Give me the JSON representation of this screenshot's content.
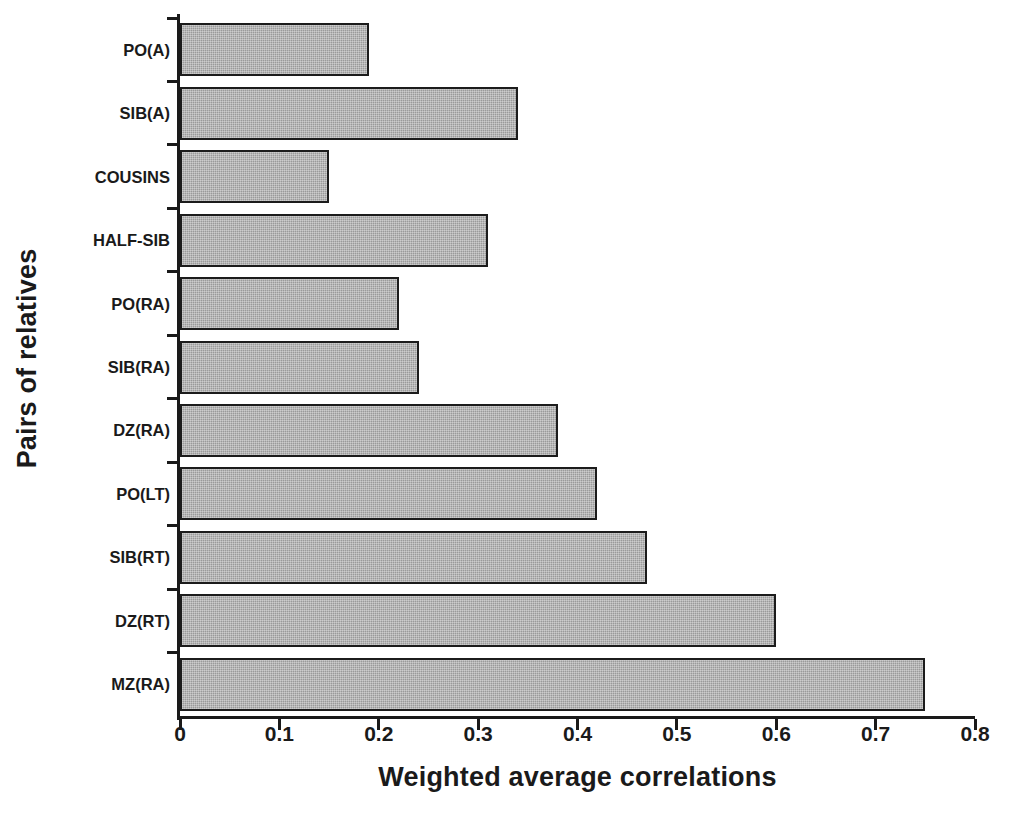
{
  "chart_data": {
    "type": "bar",
    "orientation": "horizontal",
    "title": "",
    "xlabel": "Weighted average correlations",
    "ylabel": "Pairs of relatives",
    "xlim": [
      0,
      0.8
    ],
    "xticks": [
      "0",
      "0.1",
      "0.2",
      "0.3",
      "0.4",
      "0.5",
      "0.6",
      "0.7",
      "0.8"
    ],
    "xtick_values": [
      0,
      0.1,
      0.2,
      0.3,
      0.4,
      0.5,
      0.6,
      0.7,
      0.8
    ],
    "grid": false,
    "legend": false,
    "bar_fill_color": "#9a9a9a",
    "bar_edge_color": "#1c1c1c",
    "categories": [
      "PO(A)",
      "SIB(A)",
      "COUSINS",
      "HALF-SIB",
      "PO(RA)",
      "SIB(RA)",
      "DZ(RA)",
      "PO(LT)",
      "SIB(RT)",
      "DZ(RT)",
      "MZ(RA)"
    ],
    "values": [
      0.19,
      0.34,
      0.15,
      0.31,
      0.22,
      0.24,
      0.38,
      0.42,
      0.47,
      0.6,
      0.75
    ]
  }
}
